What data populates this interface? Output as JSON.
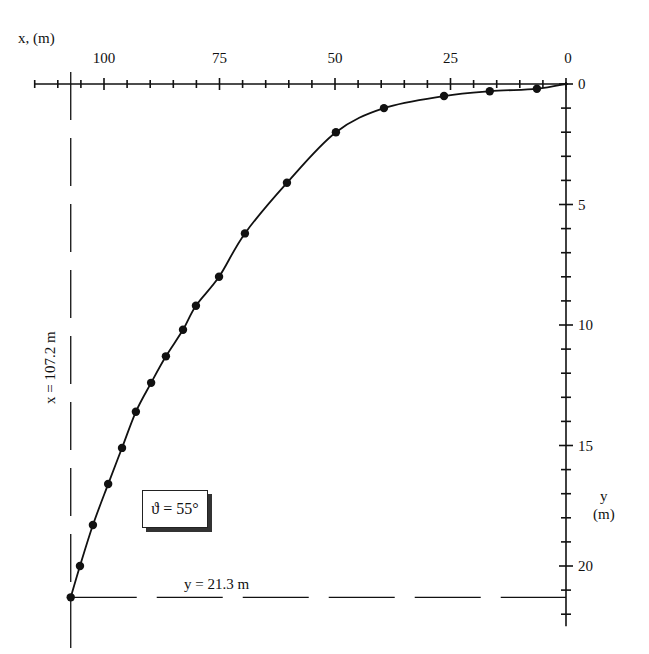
{
  "chart_data": {
    "type": "line",
    "title": "",
    "xlabel": "x, (m)",
    "ylabel": "y (m)",
    "x_axis_position": "top",
    "y_axis_position": "right",
    "x_reversed": true,
    "y_reversed": true,
    "xlim": [
      0,
      115
    ],
    "ylim": [
      0,
      22.5
    ],
    "x_ticks": [
      0,
      25,
      50,
      75,
      100
    ],
    "x_minor_tick_step": 5,
    "y_ticks": [
      0,
      5,
      10,
      15,
      20
    ],
    "y_minor_tick_step": 1,
    "grid": false,
    "series": [
      {
        "name": "trajectory",
        "marker": "filled-circle",
        "line": "smooth-solid",
        "x": [
          6.3,
          16.5,
          26.4,
          39.4,
          49.8,
          60.4,
          69.5,
          75.1,
          80.1,
          82.9,
          86.6,
          89.8,
          93.1,
          96.1,
          99.1,
          102.4,
          105.2,
          107.2
        ],
        "y": [
          0.2,
          0.3,
          0.5,
          1.0,
          2.0,
          4.1,
          6.2,
          8.0,
          9.2,
          10.2,
          11.3,
          12.4,
          13.6,
          15.1,
          16.6,
          18.3,
          20.0,
          21.3
        ]
      }
    ],
    "annotations": [
      {
        "text": "ϑ = 55°",
        "type": "boxed-label"
      },
      {
        "text": "x = 107.2 m",
        "type": "dashed-guide-vertical",
        "value": 107.2
      },
      {
        "text": "y = 21.3 m",
        "type": "dashed-guide-horizontal",
        "value": 21.3
      }
    ]
  },
  "labels": {
    "x_axis_title": "x, (m)",
    "y_axis_title_line1": "y",
    "y_axis_title_line2": "(m)",
    "x_tick_labels": [
      "100",
      "75",
      "50",
      "25",
      "0"
    ],
    "y_tick_labels": [
      "0",
      "5",
      "10",
      "15",
      "20"
    ],
    "angle_label": "ϑ = 55°",
    "x_range_label": "x = 107.2 m",
    "y_range_label": "y = 21.3 m"
  }
}
